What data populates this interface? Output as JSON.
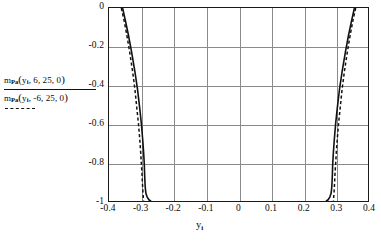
{
  "chart_data": {
    "type": "line",
    "title": "",
    "xlabel": "y_i",
    "ylabel": "",
    "xlim": [
      -0.4,
      0.4
    ],
    "ylim": [
      -1,
      0
    ],
    "grid": true,
    "legend_position": "left-outside",
    "x_ticks": [
      "-0.4",
      "-0.3",
      "-0.2",
      "-0.1",
      "0",
      "0.1",
      "0.2",
      "0.3",
      "0.4"
    ],
    "x_tick_values": [
      -0.4,
      -0.3,
      -0.2,
      -0.1,
      0,
      0.1,
      0.2,
      0.3,
      0.4
    ],
    "y_ticks": [
      "0",
      "-0.2",
      "-0.4",
      "-0.6",
      "-0.8",
      "-1"
    ],
    "y_tick_values": [
      0,
      -0.2,
      -0.4,
      -0.6,
      -0.8,
      -1
    ],
    "series": [
      {
        "name": "m_Pa(y_i, 6, 25, 0)",
        "style": "solid",
        "color": "#111111",
        "branches": [
          {
            "side": "left",
            "x": [
              -0.358,
              -0.35,
              -0.34,
              -0.33,
              -0.32,
              -0.312,
              -0.305,
              -0.3,
              -0.296,
              -0.293,
              -0.291,
              -0.29,
              -0.289,
              -0.288,
              -0.286,
              -0.282,
              -0.276,
              -0.27
            ],
            "y": [
              0.0,
              -0.06,
              -0.14,
              -0.23,
              -0.33,
              -0.42,
              -0.52,
              -0.6,
              -0.68,
              -0.75,
              -0.81,
              -0.86,
              -0.9,
              -0.93,
              -0.96,
              -0.98,
              -0.995,
              -1.0
            ]
          },
          {
            "side": "right",
            "x": [
              0.358,
              0.35,
              0.34,
              0.33,
              0.32,
              0.312,
              0.305,
              0.3,
              0.296,
              0.293,
              0.291,
              0.29,
              0.289,
              0.288,
              0.286,
              0.282,
              0.276,
              0.27
            ],
            "y": [
              0.0,
              -0.06,
              -0.14,
              -0.23,
              -0.33,
              -0.42,
              -0.52,
              -0.6,
              -0.68,
              -0.75,
              -0.81,
              -0.86,
              -0.9,
              -0.93,
              -0.96,
              -0.98,
              -0.995,
              -1.0
            ]
          }
        ]
      },
      {
        "name": "m_Pa(y_i, -6, 25, 0)",
        "style": "dashed",
        "color": "#111111",
        "branches": [
          {
            "side": "left",
            "x": [
              -0.362,
              -0.354,
              -0.345,
              -0.336,
              -0.327,
              -0.32,
              -0.314,
              -0.309,
              -0.305,
              -0.302,
              -0.3,
              -0.298,
              -0.297,
              -0.296,
              -0.295,
              -0.294,
              -0.294,
              -0.293
            ],
            "y": [
              0.0,
              -0.06,
              -0.14,
              -0.23,
              -0.33,
              -0.42,
              -0.52,
              -0.6,
              -0.68,
              -0.75,
              -0.81,
              -0.86,
              -0.9,
              -0.93,
              -0.96,
              -0.98,
              -0.995,
              -1.0
            ]
          },
          {
            "side": "right",
            "x": [
              0.362,
              0.354,
              0.345,
              0.336,
              0.327,
              0.32,
              0.314,
              0.309,
              0.305,
              0.302,
              0.3,
              0.298,
              0.297,
              0.296,
              0.295,
              0.294,
              0.294,
              0.293
            ],
            "y": [
              0.0,
              -0.06,
              -0.14,
              -0.23,
              -0.33,
              -0.42,
              -0.52,
              -0.6,
              -0.68,
              -0.75,
              -0.81,
              -0.86,
              -0.9,
              -0.93,
              -0.96,
              -0.98,
              -0.995,
              -1.0
            ]
          }
        ]
      }
    ]
  },
  "legend": {
    "entry_solid": {
      "m": "m",
      "subscript": "Pa",
      "open": "(",
      "variable": "y",
      "var_sub": "i",
      "args": ", 6, 25, 0",
      "close": ")"
    },
    "entry_dashed": {
      "m": "m",
      "subscript": "Pa",
      "open": "(",
      "variable": "y",
      "var_sub": "i",
      "args": ", -6, 25, 0",
      "close": ")"
    }
  },
  "axis": {
    "x_title_main": "y",
    "x_title_sub": "i"
  }
}
